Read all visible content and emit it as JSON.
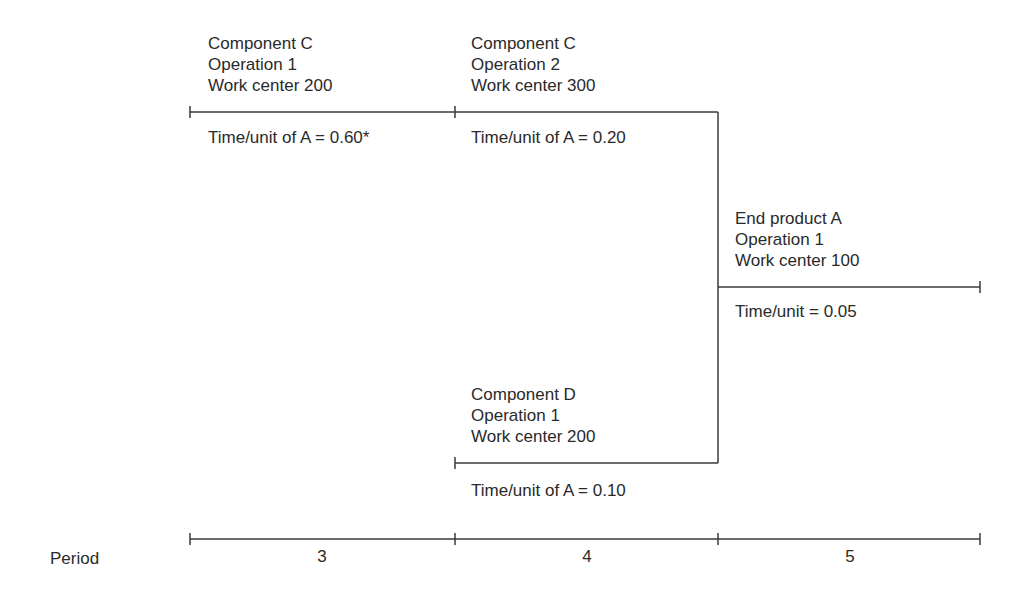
{
  "diagram": {
    "operations": [
      {
        "id": "comp-c-op1",
        "lines": [
          "Component C",
          "Operation 1",
          "Work center 200"
        ],
        "time": "Time/unit of A = 0.60*"
      },
      {
        "id": "comp-c-op2",
        "lines": [
          "Component C",
          "Operation 2",
          "Work center 300"
        ],
        "time": "Time/unit of A = 0.20"
      },
      {
        "id": "end-product-a-op1",
        "lines": [
          "End product A",
          "Operation 1",
          "Work center 100"
        ],
        "time": "Time/unit = 0.05"
      },
      {
        "id": "comp-d-op1",
        "lines": [
          "Component D",
          "Operation 1",
          "Work center 200"
        ],
        "time": "Time/unit of A = 0.10"
      }
    ],
    "axis": {
      "label": "Period",
      "periods": [
        "3",
        "4",
        "5"
      ]
    },
    "colors": {
      "line": "#3a3a3a",
      "text": "#2a2a2a",
      "background": "#ffffff"
    }
  }
}
